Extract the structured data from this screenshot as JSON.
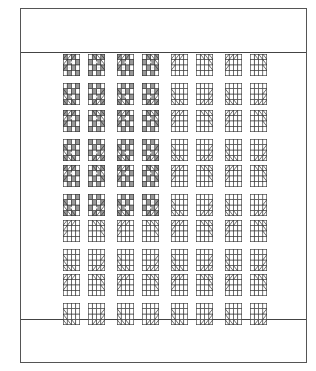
{
  "quilt": {
    "title": "",
    "layout": {
      "rows": 5,
      "cols": 4
    },
    "colors": {
      "outline": "#333333",
      "shade": "#9a9a9a",
      "light": "#ffffff",
      "accent_dot": "#e8e8e8"
    },
    "shaded_blocks": [
      [
        1,
        1
      ],
      [
        1,
        2
      ],
      [
        2,
        1
      ],
      [
        2,
        2
      ],
      [
        3,
        1
      ],
      [
        3,
        2
      ]
    ],
    "col_x": [
      42,
      96,
      150,
      204
    ],
    "row_y": [
      44,
      100,
      155,
      210,
      264
    ]
  }
}
